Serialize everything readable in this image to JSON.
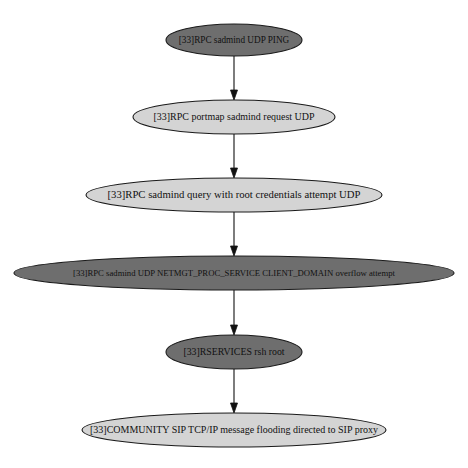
{
  "graph": {
    "layout": "top-to-bottom",
    "colors": {
      "dark_fill": "#6e6e6e",
      "light_fill": "#d4d4d4",
      "stroke": "#1a1a1a",
      "edge": "#111111",
      "text": "#111111",
      "background": "#ffffff"
    },
    "nodes": [
      {
        "id": "n1",
        "label": "[33]RPC sadmind UDP PING",
        "style": "dark",
        "cx": 234,
        "cy": 40,
        "rx": 68,
        "ry": 16
      },
      {
        "id": "n2",
        "label": "[33]RPC portmap sadmind request UDP",
        "style": "light",
        "cx": 234,
        "cy": 117,
        "rx": 101,
        "ry": 17
      },
      {
        "id": "n3",
        "label": "[33]RPC sadmind query with root credentials attempt UDP",
        "style": "light",
        "cx": 234,
        "cy": 195,
        "rx": 148,
        "ry": 17
      },
      {
        "id": "n4",
        "label": "[33]RPC sadmind UDP NETMGT_PROC_SERVICE CLIENT_DOMAIN overflow attempt",
        "style": "dark",
        "cx": 234,
        "cy": 273,
        "rx": 220,
        "ry": 17
      },
      {
        "id": "n5",
        "label": "[33]RSERVICES rsh root",
        "style": "dark",
        "cx": 234,
        "cy": 352,
        "rx": 68,
        "ry": 17
      },
      {
        "id": "n6",
        "label": "[33]COMMUNITY SIP TCP/IP message flooding directed to SIP proxy",
        "style": "light",
        "cx": 234,
        "cy": 430,
        "rx": 152,
        "ry": 17
      }
    ],
    "edges": [
      {
        "from": "n1",
        "to": "n2"
      },
      {
        "from": "n2",
        "to": "n3"
      },
      {
        "from": "n3",
        "to": "n4"
      },
      {
        "from": "n4",
        "to": "n5"
      },
      {
        "from": "n5",
        "to": "n6"
      }
    ]
  }
}
